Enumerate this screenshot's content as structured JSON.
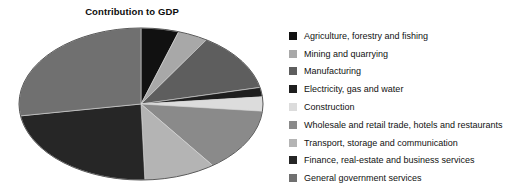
{
  "chart_data": {
    "type": "pie",
    "title": "Contribution to GDP",
    "xlabel": "",
    "ylabel": "",
    "legend_position": "right",
    "grid": false,
    "categories": [
      "Agriculture, forestry and fishing",
      "Mining and quarrying",
      "Manufacturing",
      "Electricity, gas and water",
      "Construction",
      "Wholesale and retail trade, hotels and restaurants",
      "Transport, storage and communication",
      "Finance, real-estate and business services",
      "General government services"
    ],
    "values": [
      5,
      4,
      12.5,
      2,
      3,
      13.5,
      9.5,
      23,
      27.5
    ],
    "colors": [
      "#111111",
      "#a8a8a8",
      "#5e5e5e",
      "#1e1e1e",
      "#dcdcdc",
      "#8a8a8a",
      "#b4b4b4",
      "#262626",
      "#707070"
    ]
  },
  "chart": {
    "title": "Contribution to GDP"
  },
  "legend": {
    "items": [
      {
        "label": "Agriculture, forestry and fishing",
        "color": "#111111"
      },
      {
        "label": "Mining and quarrying",
        "color": "#a8a8a8"
      },
      {
        "label": "Manufacturing",
        "color": "#5e5e5e"
      },
      {
        "label": "Electricity, gas and water",
        "color": "#1e1e1e"
      },
      {
        "label": "Construction",
        "color": "#dcdcdc"
      },
      {
        "label": "Wholesale and retail trade, hotels and restaurants",
        "color": "#8a8a8a"
      },
      {
        "label": "Transport, storage and communication",
        "color": "#b4b4b4"
      },
      {
        "label": "Finance, real-estate and business services",
        "color": "#262626"
      },
      {
        "label": "General government services",
        "color": "#707070"
      }
    ]
  }
}
